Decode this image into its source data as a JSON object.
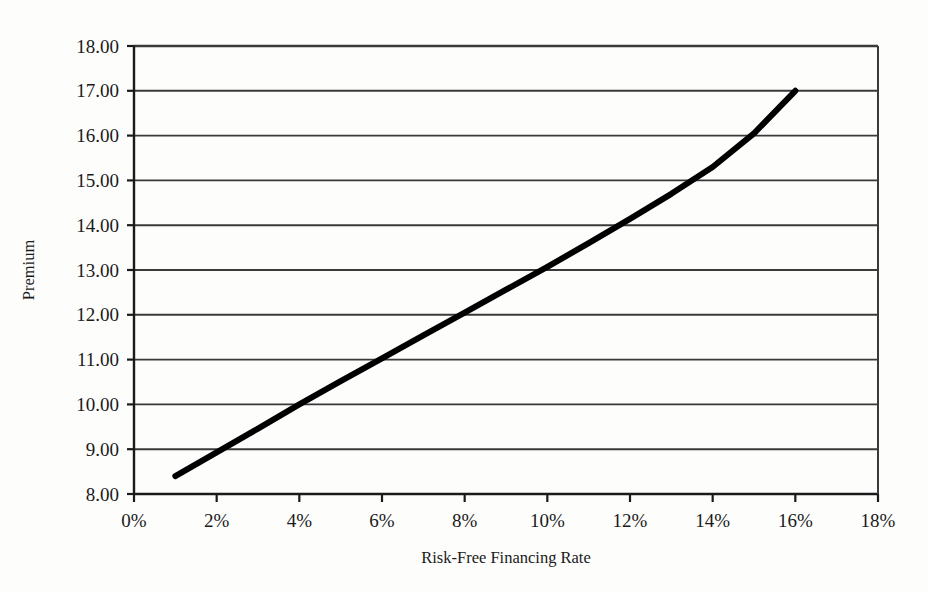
{
  "chart_data": {
    "type": "line",
    "title": "",
    "xlabel": "Risk-Free Financing Rate",
    "ylabel": "Premium",
    "xlim": [
      0,
      18
    ],
    "ylim": [
      8,
      18
    ],
    "xtick_labels": [
      "0%",
      "2%",
      "4%",
      "6%",
      "8%",
      "10%",
      "12%",
      "14%",
      "16%",
      "18%"
    ],
    "xticks": [
      0,
      2,
      4,
      6,
      8,
      10,
      12,
      14,
      16,
      18
    ],
    "ytick_labels": [
      "8.00",
      "9.00",
      "10.00",
      "11.00",
      "12.00",
      "13.00",
      "14.00",
      "15.00",
      "16.00",
      "17.00",
      "18.00"
    ],
    "yticks": [
      8,
      9,
      10,
      11,
      12,
      13,
      14,
      15,
      16,
      17,
      18
    ],
    "grid": "horizontal",
    "legend": "none",
    "series": [
      {
        "name": "Premium",
        "color": "#000000",
        "line_width": 6,
        "x": [
          1.0,
          2.0,
          3.0,
          4.0,
          5.0,
          6.0,
          7.0,
          8.0,
          9.0,
          10.0,
          11.0,
          12.0,
          13.0,
          14.0,
          15.0,
          16.0
        ],
        "values": [
          8.4,
          8.93,
          9.46,
          10.0,
          10.52,
          11.03,
          11.54,
          12.05,
          12.56,
          13.07,
          13.6,
          14.14,
          14.7,
          15.3,
          16.05,
          17.0
        ]
      }
    ]
  },
  "axes": {
    "x_title": "Risk-Free Financing Rate",
    "y_title": "Premium"
  },
  "style": {
    "plot_background": "#fdfdfc",
    "grid_color": "#3a3a3a",
    "axis_color": "#1a1a1a",
    "series_color": "#000000"
  }
}
